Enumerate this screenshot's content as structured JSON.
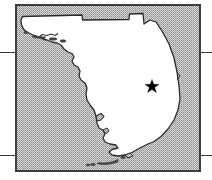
{
  "figure": {
    "kind": "locator-map",
    "region_name": "Florida",
    "width_px": 212,
    "height_px": 180,
    "caption": ""
  },
  "map": {
    "title": "Florida",
    "land_label": "Florida peninsula and panhandle",
    "water_label": "Gulf of Mexico and Atlantic Ocean",
    "frame": {
      "left_px": 15,
      "top_px": 4,
      "width_px": 186,
      "height_px": 168,
      "border_color": "#3d3d3d",
      "border_width_px": 2
    },
    "colors": {
      "land_fill": "#ffffff",
      "water_fill": "#c9c9c9",
      "water_stipple_dot": "#9a9a9a",
      "coastline": "#2b2b2b",
      "frame_border": "#3d3d3d",
      "marker": "#000000",
      "rule_line": "#3a3a3a",
      "page_background": "#ffffff"
    }
  },
  "markers": [
    {
      "name": "study-site-star",
      "symbol": "star",
      "label": "",
      "x_px": 152,
      "y_px": 86,
      "size_px": 14,
      "color": "#000000"
    }
  ],
  "rules": [
    {
      "name": "rule-left-top",
      "side": "left",
      "y_px": 52
    },
    {
      "name": "rule-left-bottom",
      "side": "left",
      "y_px": 155
    },
    {
      "name": "rule-right-top",
      "side": "right",
      "y_px": 52
    },
    {
      "name": "rule-right-bottom",
      "side": "right",
      "y_px": 155
    }
  ]
}
